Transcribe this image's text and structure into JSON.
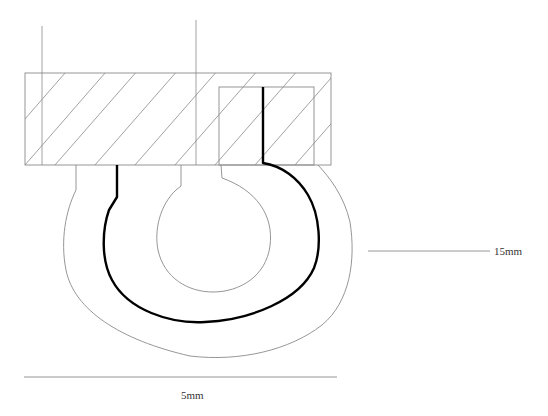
{
  "diagram": {
    "type": "engineering cross-section drawing",
    "labels": {
      "width_dimension": "5mm",
      "height_dimension": "15mm"
    },
    "colors": {
      "background": "#ffffff",
      "thin_line": "#8a8a8a",
      "thick_line": "#000000",
      "text": "#333333"
    },
    "components": [
      "hatched base block",
      "inner rectangular recess",
      "outer rounded body contour",
      "inner circular hole",
      "thick path outline",
      "vertical reference lines",
      "horizontal dimension line",
      "leader line"
    ]
  }
}
